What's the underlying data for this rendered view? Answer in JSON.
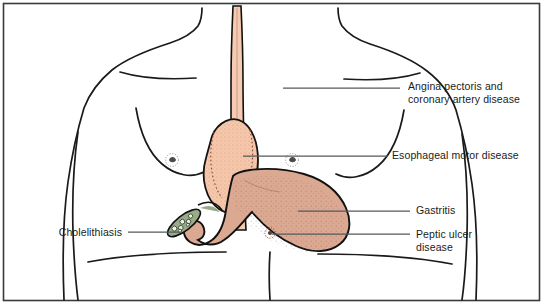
{
  "figure": {
    "border_color": "#3a3a3a",
    "background_color": "#ffffff"
  },
  "colors": {
    "outline": "#111111",
    "leader_line": "#55595c",
    "body_outline": "#1a1a1a",
    "esophagus_fill": "#f6cbb1",
    "heart_fill": "#f6c7ab",
    "stomach_fill": "#dba992",
    "stomach_shade": "#d4a08a",
    "gallbladder_fill": "#97ab86",
    "gallstone_fill": "#e8efe2",
    "stipple": "#8a5a46",
    "label_text": "#1a1a1a"
  },
  "labels": [
    {
      "id": "angina",
      "text": "Angina pectoris and\ncoronary artery disease",
      "side": "right",
      "x": 408,
      "y": 80,
      "leader": {
        "x1": 283,
        "y1": 88,
        "x2": 400,
        "y2": 88
      },
      "target": "heart"
    },
    {
      "id": "esophageal-motor",
      "text": "Esophageal motor disease",
      "side": "right",
      "x": 392,
      "y": 149,
      "leader": {
        "x1": 243,
        "y1": 156,
        "x2": 388,
        "y2": 156
      },
      "target": "esophagus"
    },
    {
      "id": "gastritis",
      "text": "Gastritis",
      "side": "right",
      "x": 416,
      "y": 204,
      "leader": {
        "x1": 298,
        "y1": 211,
        "x2": 410,
        "y2": 211
      },
      "target": "stomach-body"
    },
    {
      "id": "peptic-ulcer",
      "text": "Peptic ulcer\ndisease",
      "side": "right",
      "x": 416,
      "y": 228,
      "leader": {
        "x1": 272,
        "y1": 234,
        "x2": 410,
        "y2": 234
      },
      "target": "stomach-antrum-ulcer"
    },
    {
      "id": "cholelithiasis",
      "text": "Cholelithiasis",
      "side": "left",
      "x": 122,
      "y": 226,
      "leader": {
        "x1": 128,
        "y1": 232,
        "x2": 180,
        "y2": 232
      },
      "target": "gallbladder"
    }
  ],
  "anatomy": [
    {
      "id": "esophagus",
      "name": "esophagus",
      "fill": "#f6cbb1"
    },
    {
      "id": "heart",
      "name": "heart",
      "fill": "#f6c7ab"
    },
    {
      "id": "stomach",
      "name": "stomach",
      "fill": "#dba992"
    },
    {
      "id": "gallbladder",
      "name": "gallbladder-with-gallstones",
      "fill": "#97ab86"
    },
    {
      "id": "nipple-left",
      "name": "left-nipple-marker",
      "fill": "#6b6b6b"
    },
    {
      "id": "nipple-right",
      "name": "right-nipple-marker",
      "fill": "#6b6b6b"
    },
    {
      "id": "ulcer-marker",
      "name": "ulcer-marker",
      "fill": "#5a4034"
    }
  ]
}
